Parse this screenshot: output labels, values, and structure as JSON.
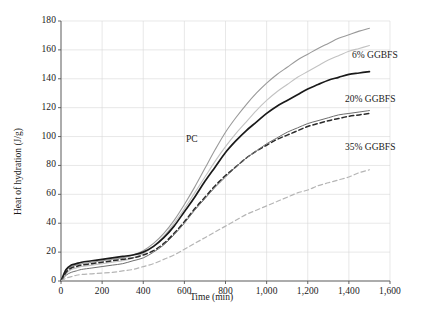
{
  "chart_data": {
    "type": "line",
    "title": "",
    "xlabel": "Time (min)",
    "ylabel": "Heat of hydration (J/g)",
    "xlim": [
      0,
      1600
    ],
    "ylim": [
      0,
      180
    ],
    "grid": true,
    "legend_position": "inline-annotations",
    "xticks": [
      "0",
      "200",
      "400",
      "600",
      "800",
      "1,000",
      "1,200",
      "1,400",
      "1,600"
    ],
    "xtick_values": [
      0,
      200,
      400,
      600,
      800,
      1000,
      1200,
      1400,
      1600
    ],
    "yticks": [
      "0",
      "20",
      "40",
      "60",
      "80",
      "100",
      "120",
      "140",
      "160",
      "180"
    ],
    "ytick_values": [
      0,
      20,
      40,
      60,
      80,
      100,
      120,
      140,
      160,
      180
    ],
    "x": [
      0,
      25,
      50,
      75,
      100,
      150,
      200,
      250,
      300,
      350,
      400,
      450,
      500,
      550,
      600,
      650,
      700,
      750,
      800,
      850,
      900,
      950,
      1000,
      1050,
      1100,
      1150,
      1200,
      1250,
      1300,
      1350,
      1400,
      1450,
      1500
    ],
    "series": [
      {
        "name": "PC",
        "color": "#9a9a9a",
        "style": "solid",
        "width": 1.1,
        "final_value": 175,
        "values": [
          0,
          7,
          10,
          11,
          12,
          13,
          14,
          15,
          16,
          18,
          21,
          26,
          33,
          42,
          53,
          65,
          78,
          91,
          103,
          113,
          122,
          130,
          137,
          143,
          148,
          153,
          157,
          161,
          164.5,
          168,
          170.5,
          173,
          175
        ]
      },
      {
        "name": "6% GGBFS",
        "color": "#c2c2c2",
        "style": "solid",
        "width": 1.1,
        "final_value": 163,
        "values": [
          0,
          5,
          8,
          9,
          10,
          11,
          12,
          13,
          14,
          16,
          19,
          24,
          31,
          40,
          50,
          61,
          72,
          83,
          93,
          102,
          110,
          118,
          125,
          131,
          136,
          141,
          145,
          149,
          153,
          156,
          159,
          161,
          163
        ]
      },
      {
        "name": "20% GGBFS",
        "color": "#1a1a1a",
        "style": "solid",
        "width": 1.7,
        "final_value": 145,
        "values": [
          0,
          8,
          11,
          12,
          13,
          14,
          15,
          16,
          17,
          18,
          20,
          24,
          30,
          38,
          48,
          58,
          69,
          79,
          89,
          97,
          104,
          110,
          116,
          121,
          125,
          129,
          133,
          136,
          139,
          141,
          143,
          144,
          145
        ]
      },
      {
        "name": "20% GGBFS (dashed)",
        "color": "#2a2a2a",
        "style": "dashed",
        "width": 1.5,
        "final_value": 116,
        "values": [
          0,
          6,
          9,
          10,
          11,
          12,
          13,
          14,
          15,
          16,
          18,
          21,
          26,
          33,
          41,
          50,
          58,
          66,
          73,
          79,
          85,
          90,
          94,
          98,
          101,
          104,
          107,
          109,
          111,
          112.5,
          114,
          115,
          116
        ]
      },
      {
        "name": "20% GGBFS (gray)",
        "color": "#6e6e6e",
        "style": "solid",
        "width": 1.0,
        "final_value": 118,
        "values": [
          0,
          4,
          6,
          7,
          8,
          9,
          10,
          11,
          12,
          14,
          16,
          20,
          25,
          32,
          40,
          49,
          57,
          65,
          72,
          79,
          85,
          90,
          95,
          99,
          103,
          106,
          109,
          111,
          113,
          115,
          116,
          117,
          118
        ]
      },
      {
        "name": "35% GGBFS",
        "color": "#b5b5b5",
        "style": "dashed",
        "width": 1.2,
        "final_value": 77,
        "values": [
          0,
          2,
          3,
          4,
          4.5,
          5,
          5.5,
          6,
          7,
          8,
          10,
          12,
          15,
          18,
          22,
          26,
          30,
          34,
          38,
          42,
          46,
          49,
          52,
          55,
          58,
          61,
          63,
          66,
          68,
          70,
          72,
          75,
          77
        ]
      }
    ],
    "annotations": [
      {
        "text": "6% GGBFS",
        "x_px": 352,
        "y_px": 50
      },
      {
        "text": "20% GGBFS",
        "x_px": 345,
        "y_px": 94
      },
      {
        "text": "35% GGBFS",
        "x_px": 345,
        "y_px": 142
      },
      {
        "text": "PC",
        "x_px": 186,
        "y_px": 134
      }
    ]
  }
}
